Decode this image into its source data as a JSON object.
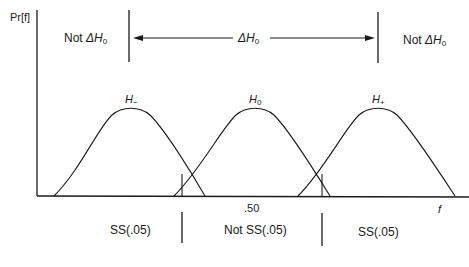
{
  "axes": {
    "y_label": "Pr[f]",
    "x_label": "f",
    "x_tick": ".50"
  },
  "top_regions": {
    "left": {
      "text": "Not ",
      "symbol": "ΔH",
      "sub": "0"
    },
    "center": {
      "symbol": "ΔH",
      "sub": "0"
    },
    "right": {
      "text": "Not ",
      "symbol": "ΔH",
      "sub": "0"
    }
  },
  "curves": [
    {
      "label": "H",
      "sub": "−"
    },
    {
      "label": "H",
      "sub": "0"
    },
    {
      "label": "H",
      "sub": "+"
    }
  ],
  "bottom_regions": {
    "left": "SS(.05)",
    "center": "Not SS(.05)",
    "right": "SS(.05)"
  },
  "colors": {
    "line": "#1a1a1a",
    "background": "#ffffff"
  }
}
